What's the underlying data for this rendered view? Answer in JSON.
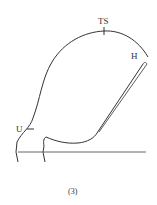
{
  "labels": {
    "ts": "TS",
    "h": "H",
    "u": "U"
  },
  "caption": "(3)",
  "colors": {
    "stroke": "#333333",
    "baseline": "#666666"
  }
}
